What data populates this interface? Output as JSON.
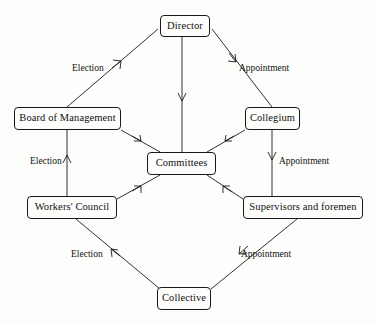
{
  "diagram": {
    "type": "organisational-flow-diagram",
    "background_color": "#fdfdfb",
    "line_color": "#1a1a1a",
    "text_color": "#111111",
    "nodes": [
      {
        "id": "director",
        "label": "Director",
        "x": 160,
        "y": 15,
        "w": 50,
        "h": 22
      },
      {
        "id": "board",
        "label": "Board of Management",
        "x": 14,
        "y": 107,
        "w": 107,
        "h": 23
      },
      {
        "id": "collegium",
        "label": "Collegium",
        "x": 245,
        "y": 107,
        "w": 55,
        "h": 23
      },
      {
        "id": "committees",
        "label": "Committees",
        "x": 147,
        "y": 152,
        "w": 69,
        "h": 23
      },
      {
        "id": "workers",
        "label": "Workers' Council",
        "x": 27,
        "y": 196,
        "w": 90,
        "h": 23
      },
      {
        "id": "supervisors",
        "label": "Supervisors and foremen",
        "x": 243,
        "y": 196,
        "w": 120,
        "h": 23
      },
      {
        "id": "collective",
        "label": "Collective",
        "x": 157,
        "y": 287,
        "w": 54,
        "h": 23
      }
    ],
    "edges": [
      {
        "id": "board-to-director",
        "from": "board",
        "to": "director",
        "relation": "Election",
        "arrow": "up-right"
      },
      {
        "id": "director-to-collegium",
        "from": "director",
        "to": "collegium",
        "relation": "Appointment",
        "arrow": "down-right"
      },
      {
        "id": "director-to-committees",
        "from": "director",
        "to": "committees",
        "relation": "",
        "arrow": "down"
      },
      {
        "id": "board-to-committees",
        "from": "board",
        "to": "committees",
        "relation": "",
        "arrow": "down-right"
      },
      {
        "id": "collegium-to-committees",
        "from": "collegium",
        "to": "committees",
        "relation": "",
        "arrow": "down-left"
      },
      {
        "id": "workers-to-board",
        "from": "workers",
        "to": "board",
        "relation": "Election",
        "arrow": "up"
      },
      {
        "id": "collegium-to-supervisors",
        "from": "collegium",
        "to": "supervisors",
        "relation": "Appointment",
        "arrow": "down"
      },
      {
        "id": "workers-to-committees",
        "from": "workers",
        "to": "committees",
        "relation": "",
        "arrow": "up-right"
      },
      {
        "id": "supervisors-to-committees",
        "from": "supervisors",
        "to": "committees",
        "relation": "",
        "arrow": "up-left"
      },
      {
        "id": "collective-to-workers",
        "from": "collective",
        "to": "workers",
        "relation": "Election",
        "arrow": "up-left"
      },
      {
        "id": "supervisors-to-collective",
        "from": "supervisors",
        "to": "collective",
        "relation": "Appointment",
        "arrow": "down-left"
      }
    ],
    "labels": [
      {
        "id": "label-election-top-left",
        "text": "Election",
        "x": 72,
        "y": 64
      },
      {
        "id": "label-appointment-top-right",
        "text": "Appointment",
        "x": 239,
        "y": 64
      },
      {
        "id": "label-election-middle-left",
        "text": "Election",
        "x": 30,
        "y": 157
      },
      {
        "id": "label-appointment-middle-right",
        "text": "Appointment",
        "x": 279,
        "y": 157
      },
      {
        "id": "label-election-bottom-left",
        "text": "Election",
        "x": 71,
        "y": 250
      },
      {
        "id": "label-appointment-bottom-right",
        "text": "Appointment",
        "x": 241,
        "y": 250
      }
    ]
  }
}
